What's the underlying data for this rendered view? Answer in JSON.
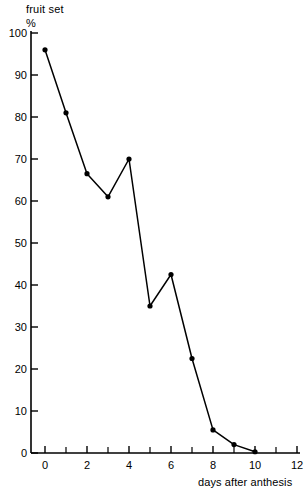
{
  "header": {
    "title_line1": "fruit set",
    "title_line2": "%"
  },
  "axis": {
    "x_title": "days after anthesis"
  },
  "chart_data": {
    "type": "line",
    "title": "fruit set %",
    "xlabel": "days after anthesis",
    "ylabel": "fruit set %",
    "xlim": [
      -0.6,
      12.4
    ],
    "ylim": [
      0,
      100
    ],
    "grid": false,
    "legend": "none",
    "marker": "filled-circle",
    "x_ticks_major": [
      0,
      2,
      4,
      6,
      8,
      10,
      12
    ],
    "x_ticks_minor": [
      1,
      3,
      5,
      7,
      9,
      11
    ],
    "x_tick_labels": [
      "0",
      "2",
      "4",
      "6",
      "8",
      "10",
      "12"
    ],
    "y_ticks": [
      0,
      10,
      20,
      30,
      40,
      50,
      60,
      70,
      80,
      90,
      100
    ],
    "y_tick_labels": [
      "0",
      "10",
      "20",
      "30",
      "40",
      "50",
      "60",
      "70",
      "80",
      "90",
      "100"
    ],
    "x": [
      0,
      1,
      2,
      3,
      4,
      5,
      6,
      7,
      8,
      9,
      10
    ],
    "values": [
      96,
      81,
      66.5,
      61,
      70,
      35,
      42.5,
      22.5,
      5.5,
      2,
      0.3
    ],
    "series": [
      {
        "name": "fruit set",
        "x": [
          0,
          1,
          2,
          3,
          4,
          5,
          6,
          7,
          8,
          9,
          10
        ],
        "values": [
          96,
          81,
          66.5,
          61,
          70,
          35,
          42.5,
          22.5,
          5.5,
          2,
          0.3
        ]
      }
    ]
  },
  "colors": {
    "line": "#000000",
    "marker": "#000000",
    "axis": "#000000",
    "background": "#ffffff"
  }
}
